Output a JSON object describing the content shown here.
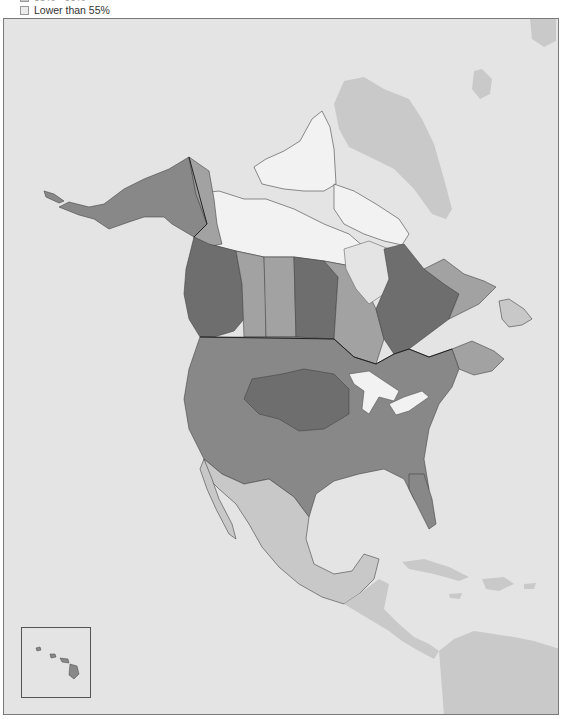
{
  "legend": {
    "items": [
      {
        "label": "55% - 60%",
        "swatch_color": "#c8c8c8",
        "truncated": true
      },
      {
        "label": "Lower than 55%",
        "swatch_color": "#ececec",
        "truncated": false
      }
    ]
  },
  "map": {
    "background_color": "#e4e4e4",
    "non_data_land_color": "#c9c9c9",
    "classes": [
      {
        "name": "highest",
        "color": "#6e6e6e"
      },
      {
        "name": "high",
        "color": "#888888"
      },
      {
        "name": "mid",
        "color": "#a2a2a2"
      },
      {
        "name": "low",
        "color": "#c8c8c8"
      },
      {
        "name": "lowest",
        "color": "#f2f2f2"
      }
    ],
    "regions": [
      {
        "name": "Alaska",
        "class": "high"
      },
      {
        "name": "Yukon",
        "class": "mid"
      },
      {
        "name": "Northwest Territories",
        "class": "lowest"
      },
      {
        "name": "Nunavut",
        "class": "lowest"
      },
      {
        "name": "British Columbia",
        "class": "highest"
      },
      {
        "name": "Alberta",
        "class": "mid"
      },
      {
        "name": "Saskatchewan",
        "class": "mid"
      },
      {
        "name": "Manitoba",
        "class": "highest"
      },
      {
        "name": "Ontario",
        "class": "mid"
      },
      {
        "name": "Quebec",
        "class": "highest"
      },
      {
        "name": "Labrador",
        "class": "mid"
      },
      {
        "name": "Newfoundland",
        "class": "low"
      },
      {
        "name": "Maritimes",
        "class": "mid"
      },
      {
        "name": "United States (most)",
        "class": "high"
      },
      {
        "name": "Northern Plains",
        "class": "highest"
      },
      {
        "name": "Mexico",
        "class": "low"
      },
      {
        "name": "Greenland",
        "class": "nodata"
      },
      {
        "name": "Central America",
        "class": "nodata"
      },
      {
        "name": "Caribbean",
        "class": "nodata"
      },
      {
        "name": "South America",
        "class": "nodata"
      }
    ],
    "inset": {
      "name": "Hawaii",
      "class": "high"
    }
  }
}
